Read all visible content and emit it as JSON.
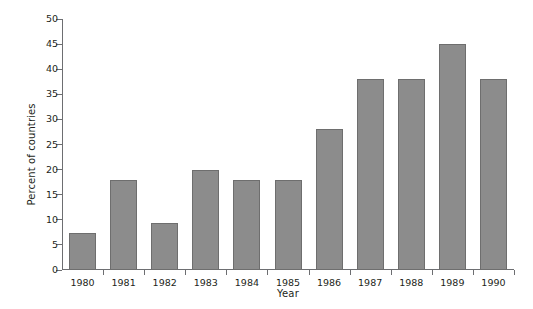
{
  "chart_data": {
    "type": "bar",
    "title": "",
    "xlabel": "Year",
    "ylabel": "Percent of countries",
    "categories": [
      "1980",
      "1981",
      "1982",
      "1983",
      "1984",
      "1985",
      "1986",
      "1987",
      "1988",
      "1989",
      "1990"
    ],
    "values": [
      7.4,
      18,
      9.3,
      20,
      18,
      18,
      28,
      38,
      38,
      45,
      38
    ],
    "ylim": [
      0,
      50
    ],
    "ytick_labels": [
      "0",
      "5",
      "10",
      "15",
      "20",
      "25",
      "30",
      "35",
      "40",
      "45",
      "50"
    ],
    "ytick_values": [
      0,
      5,
      10,
      15,
      20,
      25,
      30,
      35,
      40,
      45,
      50
    ],
    "grid": false,
    "legend": null,
    "bar_color": "#8c8c8c",
    "bar_edge_color": "#6e6e6e",
    "axis_color": "#6d6e71",
    "text_color": "#231f20"
  }
}
